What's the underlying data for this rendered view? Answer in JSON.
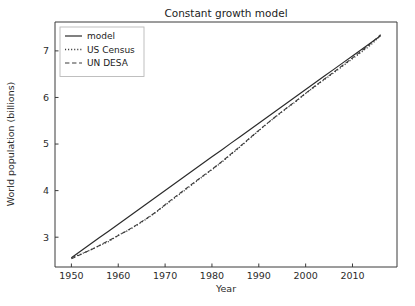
{
  "figure": {
    "width": 415,
    "height": 306,
    "background": "#ffffff"
  },
  "chart_data": {
    "type": "line",
    "title": "Constant growth model",
    "xlabel": "Year",
    "ylabel": "World population (billions)",
    "xlim": [
      1946.5,
      2019.5
    ],
    "ylim": [
      2.36,
      7.62
    ],
    "xticks": [
      1950,
      1960,
      1970,
      1980,
      1990,
      2000,
      2010
    ],
    "xtick_labels": [
      "1950",
      "1960",
      "1970",
      "1980",
      "1990",
      "2000",
      "2010"
    ],
    "yticks": [
      3,
      4,
      5,
      6,
      7
    ],
    "ytick_labels": [
      "3",
      "4",
      "5",
      "6",
      "7"
    ],
    "grid": false,
    "legend_position": "upper left",
    "x": [
      1950,
      1952,
      1954,
      1956,
      1958,
      1960,
      1962,
      1964,
      1966,
      1968,
      1970,
      1972,
      1974,
      1976,
      1978,
      1980,
      1982,
      1984,
      1986,
      1988,
      1990,
      1992,
      1994,
      1996,
      1998,
      2000,
      2002,
      2004,
      2006,
      2008,
      2010,
      2012,
      2014,
      2016
    ],
    "series": [
      {
        "name": "model",
        "style": "solid",
        "color": "#2b2b2b",
        "width": 1.2,
        "values": [
          2.557,
          2.702,
          2.846,
          2.991,
          3.135,
          3.28,
          3.424,
          3.569,
          3.713,
          3.858,
          4.002,
          4.147,
          4.291,
          4.436,
          4.58,
          4.725,
          4.869,
          5.014,
          5.158,
          5.303,
          5.447,
          5.592,
          5.736,
          5.881,
          6.025,
          6.17,
          6.314,
          6.459,
          6.603,
          6.748,
          6.892,
          7.037,
          7.181,
          7.326
        ]
      },
      {
        "name": "US Census",
        "style": "dotted",
        "color": "#3a3a3a",
        "width": 1.3,
        "values": [
          2.557,
          2.637,
          2.724,
          2.819,
          2.908,
          3.043,
          3.14,
          3.259,
          3.39,
          3.532,
          3.685,
          3.84,
          3.991,
          4.146,
          4.3,
          4.449,
          4.605,
          4.771,
          4.939,
          5.112,
          5.285,
          5.456,
          5.617,
          5.77,
          5.919,
          6.086,
          6.236,
          6.383,
          6.53,
          6.68,
          6.83,
          6.98,
          7.135,
          7.33
        ]
      },
      {
        "name": "UN DESA",
        "style": "dashed",
        "color": "#3a3a3a",
        "width": 1.1,
        "values": [
          2.536,
          2.63,
          2.723,
          2.824,
          2.93,
          3.035,
          3.148,
          3.27,
          3.399,
          3.537,
          3.7,
          3.855,
          4.008,
          4.16,
          4.311,
          4.458,
          4.615,
          4.782,
          4.95,
          5.124,
          5.294,
          5.461,
          5.622,
          5.778,
          5.93,
          6.09,
          6.246,
          6.395,
          6.545,
          6.697,
          6.85,
          7.005,
          7.165,
          7.349
        ]
      }
    ],
    "legend_entries": [
      {
        "label": "model",
        "style": "solid"
      },
      {
        "label": "US Census",
        "style": "dotted"
      },
      {
        "label": "UN DESA",
        "style": "dashed"
      }
    ]
  }
}
